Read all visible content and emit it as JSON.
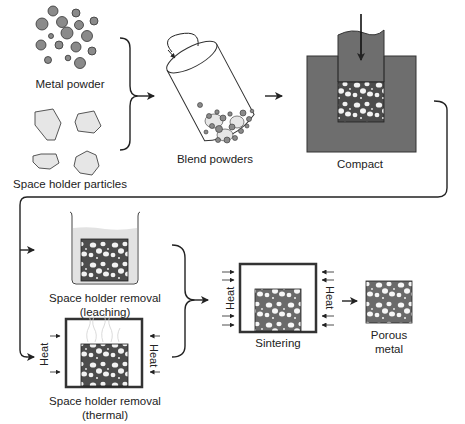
{
  "diagram": {
    "colors": {
      "ink": "#222222",
      "metal_particle": "#8a8a8a",
      "space_holder": "#e6e6e6",
      "die": "#6e6e6e",
      "compact_fill": "#4a4a4a",
      "pore": "#f4f4f4",
      "liquid": "#e2e2e2",
      "sample_fill": "#5a5a5a"
    },
    "inputs": {
      "metal_powder": {
        "label": "Metal powder"
      },
      "space_holder": {
        "label": "Space holder particles"
      }
    },
    "steps": [
      {
        "id": "blend",
        "label": "Blend powders"
      },
      {
        "id": "compact",
        "label": "Compact"
      },
      {
        "id": "leaching",
        "label_line1": "Space holder removal",
        "label_line2": "(leaching)"
      },
      {
        "id": "thermal",
        "label_line1": "Space holder removal",
        "label_line2": "(thermal)",
        "heat_left": "Heat",
        "heat_right": "Heat"
      },
      {
        "id": "sintering",
        "label": "Sintering",
        "heat_left": "Heat",
        "heat_right": "Heat"
      },
      {
        "id": "product",
        "label_line1": "Porous",
        "label_line2": "metal"
      }
    ],
    "connectors": [
      {
        "from": "inputs",
        "to": "blend",
        "type": "brace-arrow"
      },
      {
        "from": "blend",
        "to": "compact",
        "type": "arrow"
      },
      {
        "from": "compact",
        "to": "leaching/thermal",
        "type": "loop-split-arrow"
      },
      {
        "from": "leaching/thermal",
        "to": "sintering",
        "type": "brace-arrow"
      },
      {
        "from": "sintering",
        "to": "product",
        "type": "arrow"
      }
    ]
  }
}
